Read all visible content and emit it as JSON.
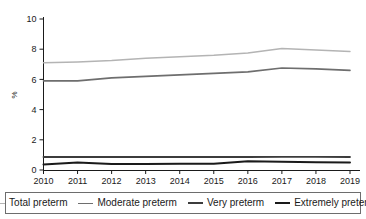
{
  "chart_data": {
    "type": "line",
    "title": "",
    "xlabel": "",
    "ylabel": "%",
    "x": [
      2010,
      2011,
      2012,
      2013,
      2014,
      2015,
      2016,
      2017,
      2018,
      2019
    ],
    "categories": [
      "2010",
      "2011",
      "2012",
      "2013",
      "2014",
      "2015",
      "2016",
      "2017",
      "2018",
      "2019"
    ],
    "xlim": [
      2010,
      2019
    ],
    "ylim": [
      0,
      10
    ],
    "yticks": [
      0,
      2,
      4,
      6,
      8,
      10
    ],
    "ytick_labels": [
      "0",
      "2",
      "4",
      "6",
      "8",
      "10"
    ],
    "grid": false,
    "legend_position": "bottom",
    "series": [
      {
        "name": "Total preterm",
        "color": "#b4b4b4",
        "width": 1.4,
        "values": [
          7.1,
          7.15,
          7.25,
          7.4,
          7.5,
          7.6,
          7.75,
          8.05,
          7.95,
          7.85
        ]
      },
      {
        "name": "Moderate preterm",
        "color": "#6e6e6e",
        "width": 1.6,
        "values": [
          5.9,
          5.9,
          6.1,
          6.2,
          6.3,
          6.4,
          6.5,
          6.75,
          6.7,
          6.6
        ]
      },
      {
        "name": "Very preterm",
        "color": "#3c3c3c",
        "width": 1.8,
        "values": [
          0.86,
          0.86,
          0.86,
          0.86,
          0.86,
          0.86,
          0.86,
          0.87,
          0.87,
          0.86
        ]
      },
      {
        "name": "Extremely preterm",
        "color": "#1a1a1a",
        "width": 2.0,
        "values": [
          0.36,
          0.5,
          0.4,
          0.4,
          0.42,
          0.42,
          0.58,
          0.55,
          0.52,
          0.5
        ]
      }
    ]
  },
  "axis": {
    "y_title": "%"
  },
  "legend": {
    "items": [
      {
        "label": "Total preterm",
        "color": "#b4b4b4",
        "width": "1.4px"
      },
      {
        "label": "Moderate preterm",
        "color": "#6e6e6e",
        "width": "1.8px"
      },
      {
        "label": "Very preterm",
        "color": "#3c3c3c",
        "width": "2px"
      },
      {
        "label": "Extremely preterm",
        "color": "#1a1a1a",
        "width": "2.4px"
      }
    ]
  }
}
